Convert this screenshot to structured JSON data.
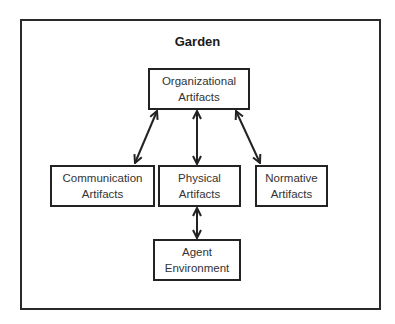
{
  "diagram": {
    "title": "Garden",
    "nodes": [
      {
        "id": "organizational",
        "line1": "Organizational",
        "line2": "Artifacts"
      },
      {
        "id": "communication",
        "line1": "Communication",
        "line2": "Artifacts"
      },
      {
        "id": "physical",
        "line1": "Physical",
        "line2": "Artifacts"
      },
      {
        "id": "normative",
        "line1": "Normative",
        "line2": "Artifacts"
      },
      {
        "id": "agent",
        "line1": "Agent",
        "line2": "Environment"
      }
    ],
    "edges": [
      {
        "from": "organizational",
        "to": "communication",
        "type": "bidirectional"
      },
      {
        "from": "organizational",
        "to": "physical",
        "type": "bidirectional"
      },
      {
        "from": "organizational",
        "to": "normative",
        "type": "bidirectional"
      },
      {
        "from": "physical",
        "to": "agent",
        "type": "bidirectional"
      }
    ],
    "colors": {
      "stroke": "#222222",
      "text": "#333333",
      "background": "#ffffff"
    }
  }
}
